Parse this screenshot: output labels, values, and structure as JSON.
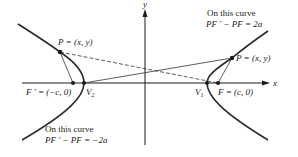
{
  "diagram": {
    "axes": {
      "x_label": "x",
      "y_label": "y"
    },
    "points": {
      "p_left": "P = (x, y)",
      "p_right": "P = (x, y)",
      "f_left": "F ' = (−c, 0)",
      "f_right": "F = (c, 0)",
      "v1": "V",
      "v1_sub": "1",
      "v2": "V",
      "v2_sub": "2"
    },
    "annotations": {
      "right_line1": "On this curve",
      "right_line2": "PF ' − PF = 2a",
      "left_line1": "On this curve",
      "left_line2": "PF ' − PF = −2a"
    },
    "colors": {
      "stroke": "#1a1a1a",
      "curve": "#2a2a2a"
    }
  }
}
